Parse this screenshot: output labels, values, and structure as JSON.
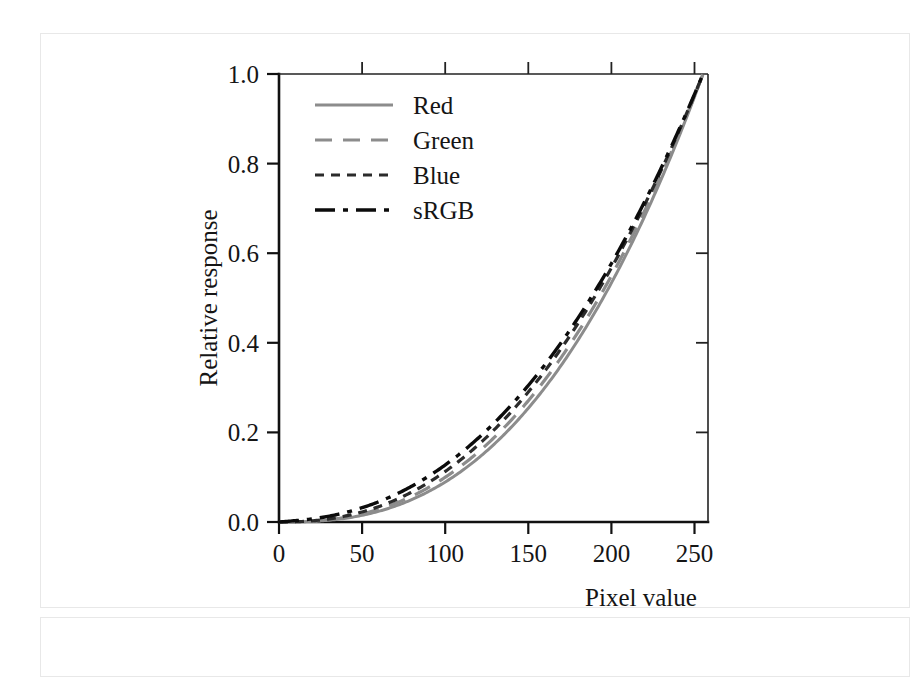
{
  "figure": {
    "name": "gamma-response-figure"
  },
  "chart_data": {
    "type": "line",
    "title": "",
    "xlabel": "Pixel value",
    "ylabel": "Relative response",
    "xlim": [
      0,
      258
    ],
    "ylim": [
      0.0,
      1.0
    ],
    "xticks": [
      0,
      50,
      100,
      150,
      200,
      250
    ],
    "xticklabels": [
      "0",
      "50",
      "100",
      "150",
      "200",
      "250"
    ],
    "yticks": [
      0.0,
      0.2,
      0.4,
      0.6,
      0.8,
      1.0
    ],
    "yticklabels": [
      "0.0",
      "0.2",
      "0.4",
      "0.6",
      "0.8",
      "1.0"
    ],
    "grid": false,
    "legend_position": "upper left",
    "x": [
      0,
      10,
      20,
      30,
      40,
      50,
      60,
      70,
      80,
      90,
      100,
      110,
      120,
      130,
      140,
      150,
      160,
      170,
      180,
      190,
      200,
      210,
      220,
      230,
      240,
      250,
      255
    ],
    "series": [
      {
        "name": "Red",
        "style": "solid",
        "color": "#8c8c8c",
        "values": [
          0.0,
          0.013,
          0.024,
          0.035,
          0.046,
          0.058,
          0.071,
          0.085,
          0.1,
          0.117,
          0.135,
          0.155,
          0.176,
          0.199,
          0.224,
          0.251,
          0.28,
          0.311,
          0.344,
          0.379,
          0.417,
          0.457,
          0.5,
          0.545,
          0.593,
          0.644,
          0.68
        ]
      },
      {
        "name": "Green",
        "style": "dashed",
        "color": "#8c8c8c",
        "values": [
          0.0,
          0.015,
          0.028,
          0.04,
          0.053,
          0.066,
          0.08,
          0.096,
          0.113,
          0.131,
          0.151,
          0.173,
          0.196,
          0.221,
          0.248,
          0.277,
          0.308,
          0.341,
          0.376,
          0.413,
          0.453,
          0.495,
          0.539,
          0.586,
          0.635,
          0.687,
          0.723
        ]
      },
      {
        "name": "Blue",
        "style": "dotted-dash",
        "color": "#2b2b2b",
        "values": [
          0.0,
          0.018,
          0.033,
          0.047,
          0.061,
          0.076,
          0.092,
          0.109,
          0.128,
          0.148,
          0.17,
          0.193,
          0.218,
          0.245,
          0.274,
          0.305,
          0.338,
          0.373,
          0.41,
          0.449,
          0.49,
          0.534,
          0.58,
          0.628,
          0.679,
          0.732,
          0.769
        ]
      },
      {
        "name": "sRGB",
        "style": "dashdot",
        "color": "#0b0b0b",
        "values": [
          0.0,
          0.003,
          0.006,
          0.01,
          0.018,
          0.031,
          0.047,
          0.067,
          0.09,
          0.117,
          0.148,
          0.182,
          0.22,
          0.262,
          0.308,
          0.358,
          0.412,
          0.47,
          0.533,
          0.6,
          0.671,
          0.747,
          0.827,
          0.912,
          1.0,
          1.0,
          1.0
        ]
      }
    ],
    "note": "All four curves converge at pixel value 255 with relative response 1.0; values above are normalized shape samples used for rendering."
  },
  "legend": {
    "entries": [
      {
        "label": "Red",
        "style": "solid",
        "color": "#8c8c8c"
      },
      {
        "label": "Green",
        "style": "dashed",
        "color": "#8c8c8c"
      },
      {
        "label": "Blue",
        "style": "dotted-dash",
        "color": "#2b2b2b"
      },
      {
        "label": "sRGB",
        "style": "dashdot",
        "color": "#0b0b0b"
      }
    ]
  },
  "axes": {
    "x_title": "Pixel value",
    "y_title": "Relative response",
    "x_tick_0": "0",
    "x_tick_1": "50",
    "x_tick_2": "100",
    "x_tick_3": "150",
    "x_tick_4": "200",
    "x_tick_5": "250",
    "y_tick_0": "0.0",
    "y_tick_1": "0.2",
    "y_tick_2": "0.4",
    "y_tick_3": "0.6",
    "y_tick_4": "0.8",
    "y_tick_5": "1.0"
  }
}
